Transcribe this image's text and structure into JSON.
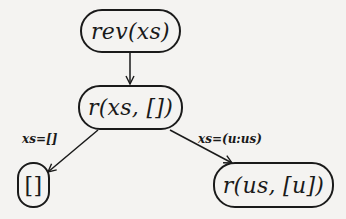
{
  "diagram": {
    "type": "evaluation-tree",
    "nodes": {
      "root": {
        "label": "rev(xs)"
      },
      "middle": {
        "label": "r(xs, [])"
      },
      "left_leaf": {
        "label": "[]"
      },
      "right_leaf": {
        "label": "r(us, [u])"
      }
    },
    "edges": {
      "root_to_middle": {
        "label": ""
      },
      "middle_to_left": {
        "label": "xs=[]"
      },
      "middle_to_right": {
        "label": "xs=(u:us)"
      }
    },
    "colors": {
      "ink": "#1a1a1a",
      "background": "#f4f3f1"
    }
  }
}
